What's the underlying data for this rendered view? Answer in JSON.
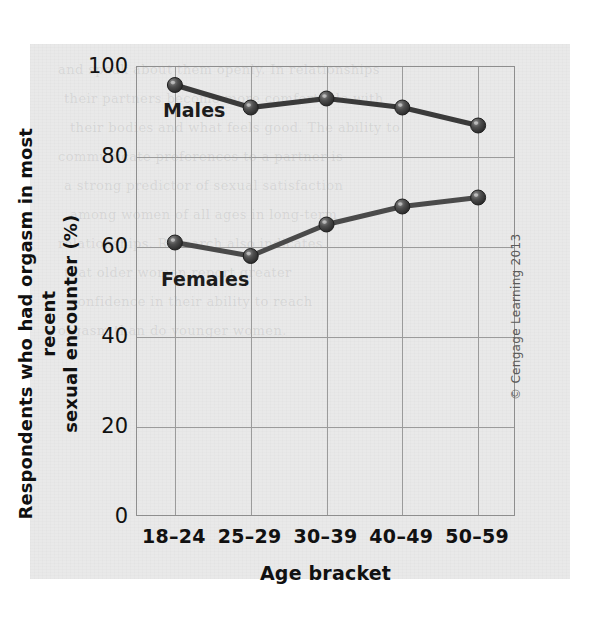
{
  "figure": {
    "copyright": "© Cengage Learning 2013",
    "ghost_text": [
      "and speak about them openly. In relationships",
      "their partners become more comfortable with",
      "their bodies and what feels good. The ability to",
      "communicate preferences to a partner is",
      "a strong predictor of sexual satisfaction",
      "among women of all ages in long-term",
      "relationships. Research also indicates",
      "that older women report greater",
      "confidence in their ability to reach",
      "orgasm than do younger women."
    ]
  },
  "chart_data": {
    "type": "line",
    "title": "",
    "xlabel": "Age bracket",
    "ylabel": "Respondents who had orgasm in most recent sexual encounter (%)",
    "ylabel_lines": [
      "Respondents who had orgasm in most recent",
      "sexual encounter (%)"
    ],
    "categories": [
      "18–24",
      "25–29",
      "30–39",
      "40–49",
      "50–59"
    ],
    "ylim": [
      0,
      100
    ],
    "yticks": [
      0,
      20,
      40,
      60,
      80,
      100
    ],
    "ytick_labels": [
      "0",
      "20",
      "40",
      "60",
      "80",
      "100"
    ],
    "grid": true,
    "legend": "inline-labels",
    "series": [
      {
        "name": "Males",
        "label": "Males",
        "color": "#3a3a3a",
        "values": [
          96,
          91,
          93,
          91,
          87
        ]
      },
      {
        "name": "Females",
        "label": "Females",
        "color": "#4a4a4a",
        "values": [
          61,
          58,
          65,
          69,
          71
        ]
      }
    ]
  }
}
